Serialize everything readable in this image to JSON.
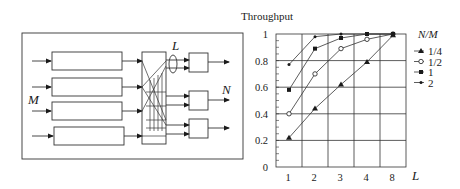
{
  "diagram": {
    "input_label": "M",
    "link_label": "L",
    "output_label": "N",
    "input_rows": 4,
    "output_boxes": 3
  },
  "chart_data": {
    "type": "line",
    "title": "Throughput",
    "xlabel": "L",
    "ylabel": "Throughput",
    "categories": [
      "1",
      "2",
      "3",
      "4",
      "8"
    ],
    "yticks": [
      "0",
      "0.2",
      "0.4",
      "0.6",
      "0.8",
      "1"
    ],
    "ylim": [
      0,
      1
    ],
    "grid": true,
    "legend_title": "N/M",
    "legend_position": "right",
    "series": [
      {
        "name": "1/4",
        "marker": "triangle",
        "values": [
          0.22,
          0.44,
          0.62,
          0.79,
          0.99
        ]
      },
      {
        "name": "1/2",
        "marker": "open-circle",
        "values": [
          0.4,
          0.7,
          0.89,
          0.96,
          1.0
        ]
      },
      {
        "name": "1",
        "marker": "filled-square",
        "values": [
          0.58,
          0.89,
          0.97,
          1.0,
          1.0
        ]
      },
      {
        "name": "2",
        "marker": "small-dot",
        "values": [
          0.77,
          0.98,
          1.0,
          1.0,
          1.0
        ]
      }
    ]
  }
}
